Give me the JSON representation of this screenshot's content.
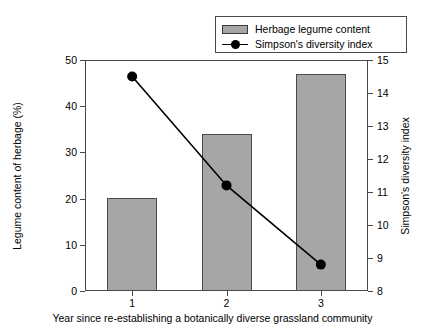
{
  "legend": {
    "items": [
      {
        "label": "Herbage legume content",
        "marker": "bar-swatch-icon"
      },
      {
        "label": "Simpson's diversity index",
        "marker": "line-marker-icon"
      }
    ]
  },
  "axes": {
    "left": {
      "title": "Legume content of herbage (%)",
      "ticks": [
        0,
        10,
        20,
        30,
        40,
        50
      ],
      "min": 0,
      "max": 50
    },
    "right": {
      "title": "Simpson's diversity index",
      "ticks": [
        8,
        9,
        10,
        11,
        12,
        13,
        14,
        15
      ],
      "min": 8,
      "max": 15
    },
    "x": {
      "title": "Year since re-establishing a botanically diverse grassland community",
      "ticks": [
        "1",
        "2",
        "3"
      ]
    }
  },
  "colors": {
    "bar_fill": "#a6a6a6",
    "bar_edge": "#4a4a4a",
    "line": "#000000",
    "marker": "#000000",
    "frame": "#4a4a4a"
  },
  "chart_data": {
    "type": "bar",
    "title": "",
    "xlabel": "Year since re-establishing a botanically diverse grassland community",
    "ylabel": "Legume content of herbage (%)",
    "y2label": "Simpson's diversity index",
    "categories": [
      "1",
      "2",
      "3"
    ],
    "ylim": [
      0,
      50
    ],
    "y2lim": [
      8,
      15
    ],
    "grid": false,
    "legend_position": "top-right",
    "series": [
      {
        "name": "Herbage legume content",
        "type": "bar",
        "axis": "left",
        "values": [
          20.1,
          34.0,
          47.0
        ]
      },
      {
        "name": "Simpson's diversity index",
        "type": "line",
        "axis": "right",
        "values": [
          14.5,
          11.2,
          8.8
        ]
      }
    ]
  }
}
